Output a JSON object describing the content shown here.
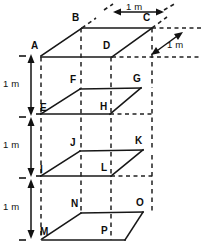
{
  "figure": {
    "type": "geometry-diagram",
    "line_color": "#171717",
    "background_color": "#ffffff"
  },
  "dimensions": [
    {
      "id": "top-width",
      "label": "1 m",
      "orientation": "horizontal",
      "x": 126,
      "y": 2
    },
    {
      "id": "depth",
      "label": "1 m",
      "orientation": "diagonal",
      "x": 167,
      "y": 39
    },
    {
      "id": "height-1",
      "label": "1 m",
      "orientation": "vertical",
      "x": 3,
      "y": 78
    },
    {
      "id": "height-2",
      "label": "1 m",
      "orientation": "vertical",
      "x": 3,
      "y": 139
    },
    {
      "id": "height-3",
      "label": "1 m",
      "orientation": "vertical",
      "x": 3,
      "y": 201
    }
  ],
  "vertices": [
    {
      "id": "A",
      "label": "A",
      "x": 31,
      "y": 41
    },
    {
      "id": "B",
      "label": "B",
      "x": 72,
      "y": 13
    },
    {
      "id": "C",
      "label": "C",
      "x": 143,
      "y": 13
    },
    {
      "id": "D",
      "label": "D",
      "x": 103,
      "y": 41
    },
    {
      "id": "E",
      "label": "E",
      "x": 40,
      "y": 103
    },
    {
      "id": "F",
      "label": "F",
      "x": 70,
      "y": 75
    },
    {
      "id": "G",
      "label": "G",
      "x": 133,
      "y": 74
    },
    {
      "id": "H",
      "label": "H",
      "x": 100,
      "y": 102
    },
    {
      "id": "I",
      "label": "I",
      "x": 40,
      "y": 165
    },
    {
      "id": "J",
      "label": "J",
      "x": 70,
      "y": 138
    },
    {
      "id": "K",
      "label": "K",
      "x": 135,
      "y": 136
    },
    {
      "id": "L",
      "label": "L",
      "x": 101,
      "y": 163
    },
    {
      "id": "M",
      "label": "M",
      "x": 40,
      "y": 227
    },
    {
      "id": "N",
      "label": "N",
      "x": 71,
      "y": 199
    },
    {
      "id": "O",
      "label": "O",
      "x": 136,
      "y": 198
    },
    {
      "id": "P",
      "label": "P",
      "x": 101,
      "y": 226
    }
  ]
}
